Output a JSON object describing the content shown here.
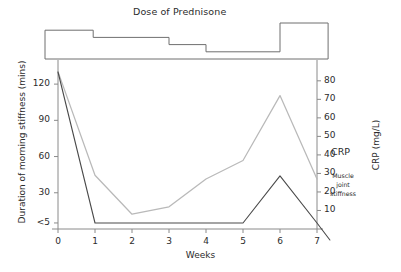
{
  "figure": {
    "dose_title": "Dose of Prednisone",
    "xlabel": "Weeks",
    "ylabel_left": "Duration of morning stiffness (mins)",
    "ylabel_right": "CRP (mg/L)"
  },
  "ticks": {
    "left": [
      "120",
      "90",
      "60",
      "30",
      "<5"
    ],
    "right": [
      "80",
      "70",
      "60",
      "50",
      "40",
      "30",
      "20",
      "10"
    ],
    "x": [
      "0",
      "1",
      "2",
      "3",
      "4",
      "5",
      "6",
      "7"
    ]
  },
  "annotations": {
    "crp": "CRP",
    "stiffness_line1": "Muscle",
    "stiffness_line2": "joint",
    "stiffness_line3": "stiffness"
  },
  "colors": {
    "crp_line": "#b9b9b9",
    "stiffness_line": "#4a4a4a",
    "axis": "#8a8a8a",
    "dose_step": "#6f6f6f",
    "text": "#2b2b2b",
    "background": "#ffffff"
  },
  "chart_data": {
    "type": "line",
    "title": "Dose of Prednisone",
    "xlabel": "Weeks",
    "x": [
      0,
      1,
      2,
      3,
      4,
      5,
      6,
      7
    ],
    "xlim": [
      0,
      7
    ],
    "grid": false,
    "legend_position": "inline-right",
    "series": [
      {
        "name": "CRP",
        "axis": "right",
        "unit": "mg/L",
        "color": "#b9b9b9",
        "values": [
          85,
          29,
          8,
          12,
          27,
          37,
          72,
          27
        ],
        "ylabel": "CRP (mg/L)",
        "ylim": [
          0,
          88
        ],
        "yticks": [
          10,
          20,
          30,
          40,
          50,
          60,
          70,
          80
        ]
      },
      {
        "name": "Muscle joint stiffness",
        "axis": "left",
        "unit": "mins",
        "color": "#4a4a4a",
        "values": [
          130,
          5,
          5,
          5,
          5,
          5,
          44,
          5
        ],
        "ylabel": "Duration of morning stiffness (mins)",
        "ylim": [
          0,
          135
        ],
        "yticks": [
          5,
          30,
          60,
          90,
          120
        ],
        "ytick_labels": [
          "<5",
          "30",
          "60",
          "90",
          "120"
        ],
        "note": "line continues descending below axis after week 7"
      }
    ],
    "dose_steps": {
      "name": "Dose of Prednisone",
      "type": "step",
      "color": "#6f6f6f",
      "levels": [
        {
          "from_week": -0.35,
          "to_week": 0.95,
          "level": 4
        },
        {
          "from_week": 0.95,
          "to_week": 3.0,
          "level": 3
        },
        {
          "from_week": 3.0,
          "to_week": 4.0,
          "level": 2
        },
        {
          "from_week": 4.0,
          "to_week": 6.0,
          "level": 1
        },
        {
          "from_week": 6.0,
          "to_week": 7.3,
          "level": 5
        }
      ]
    }
  }
}
